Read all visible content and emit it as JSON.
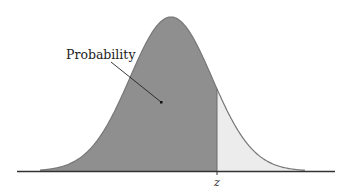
{
  "diagram": {
    "type": "normal-distribution-cdf",
    "label": "Probability",
    "z_label": "z",
    "colors": {
      "shaded": "#8f8f8f",
      "tail": "#ececec",
      "curve": "#777777",
      "axis": "#333333",
      "background": "#ffffff"
    },
    "geometry": {
      "peak_x": 171,
      "peak_y": 17,
      "baseline_y": 171,
      "sigma_px": 41,
      "z_x": 217,
      "axis_x_start": 17,
      "axis_x_end": 335
    }
  }
}
